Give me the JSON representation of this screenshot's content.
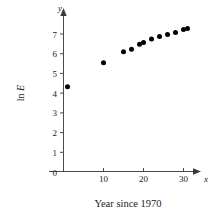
{
  "chart_data": {
    "type": "scatter",
    "title": "",
    "subtitle": "",
    "xlabel": "Year since 1970",
    "ylabel": "ln E",
    "x_axis_name": "x",
    "y_axis_name": "y",
    "xlim": [
      0,
      33
    ],
    "ylim": [
      0,
      7.6
    ],
    "grid": false,
    "legend": null,
    "x_ticks": [
      0,
      10,
      20,
      30
    ],
    "x_tick_labels": [
      "0",
      "10",
      "20",
      "30"
    ],
    "y_ticks": [
      0,
      1,
      2,
      3,
      4,
      5,
      6,
      7
    ],
    "y_tick_labels": [
      "0",
      "1",
      "2",
      "3",
      "4",
      "5",
      "6",
      "7"
    ],
    "marker": "filled-circle",
    "marker_color": "#000000",
    "points": [
      {
        "x": 1,
        "y": 4.3
      },
      {
        "x": 10,
        "y": 5.52
      },
      {
        "x": 15,
        "y": 6.07
      },
      {
        "x": 17,
        "y": 6.2
      },
      {
        "x": 19,
        "y": 6.45
      },
      {
        "x": 20,
        "y": 6.55
      },
      {
        "x": 22,
        "y": 6.72
      },
      {
        "x": 24,
        "y": 6.85
      },
      {
        "x": 26,
        "y": 6.95
      },
      {
        "x": 28,
        "y": 7.05
      },
      {
        "x": 30,
        "y": 7.2
      },
      {
        "x": 31,
        "y": 7.25
      }
    ]
  },
  "caption": {
    "text": "Year since 1970"
  },
  "colors": {
    "axis": "#4a4a4a",
    "marker": "#000000",
    "text": "#1a1a1a",
    "background": "#ffffff"
  }
}
